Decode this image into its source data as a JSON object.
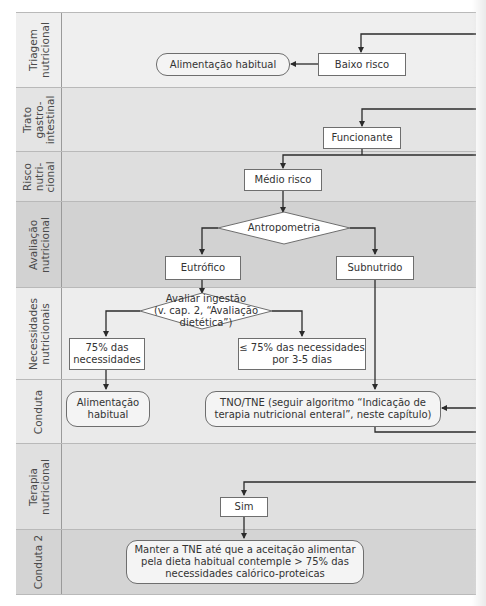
{
  "colors": {
    "lane_light": "#eeeeee",
    "lane_mid": "#e2e2e2",
    "lane_dark": "#d3d3d3",
    "line": "#2b2b2b",
    "node_border": "#6e6e6e"
  },
  "lanes": [
    {
      "label": "Triagem\nnutricional"
    },
    {
      "label": "Trato\ngastro-\nintestinal"
    },
    {
      "label": "Risco\nnutri-\ncional"
    },
    {
      "label": "Avaliação\nnutricional"
    },
    {
      "label": "Necessidades\nnutricionais"
    },
    {
      "label": "Conduta"
    },
    {
      "label": "Terapia\nnutricional"
    },
    {
      "label": "Conduta 2"
    }
  ],
  "nodes": {
    "alimentacao_habitual_1": "Alimentação habitual",
    "baixo_risco": "Baixo risco",
    "funcionante": "Funcionante",
    "medio_risco": "Médio risco",
    "antropometria": "Antropometria",
    "eutrofico": "Eutrófico",
    "subnutrido": "Subnutrido",
    "avaliar_ingestao": "Avaliar ingestão\n(v. cap. 2, “Avaliação\ndietética”)",
    "75_necessidades": "75% das\nnecessidades",
    "le75_necessidades": "≤ 75% das necessidades\npor 3-5 dias",
    "alimentacao_habitual_2": "Alimentação\nhabitual",
    "tno_tne": "TNO/TNE (seguir algoritmo “Indicação de\nterapia nutricional enteral”, neste capítulo)",
    "sim": "Sim",
    "manter_tne": "Manter a TNE até que a aceitação alimentar\npela dieta habitual contemple > 75% das\nnecessidades calórico-proteicas"
  }
}
